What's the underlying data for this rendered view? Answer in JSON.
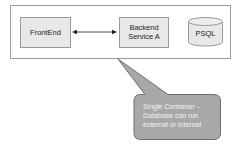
{
  "diagram": {
    "container": {
      "label": ""
    },
    "nodes": [
      {
        "id": "frontend",
        "label": "FrontEnd",
        "shape": "rectangle"
      },
      {
        "id": "backend",
        "label_line1": "Backend",
        "label_line2": "Service A",
        "shape": "rectangle"
      },
      {
        "id": "psql",
        "label": "PSQL",
        "shape": "cylinder"
      }
    ],
    "edges": [
      {
        "from": "frontend",
        "to": "backend",
        "type": "bidirectional-arrow"
      }
    ],
    "callout": {
      "line1": "Single Container -",
      "line2": "Database can run",
      "line3": "external or internal"
    },
    "colors": {
      "box_fill": "#e8e8e8",
      "box_stroke": "#9a9a9a",
      "callout_fill": "#a8a8a8",
      "callout_stroke": "#6e6e6e",
      "container_stroke": "#9a9a9a"
    }
  }
}
